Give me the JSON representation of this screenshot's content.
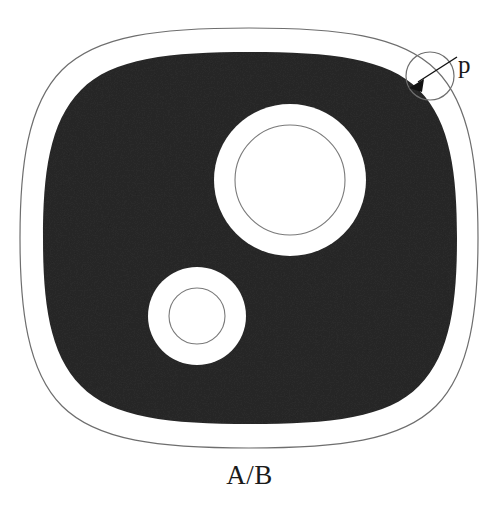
{
  "figure": {
    "title": "A/B",
    "caption": "A/B",
    "annotation_label": "p",
    "colors": {
      "background": "#ffffff",
      "fill_dark": "#2b2b2b",
      "contour_line": "#6e6e6e",
      "text": "#1a1a1a",
      "arrow": "#111111"
    },
    "shapes": {
      "outer_contour": {
        "name": "set-A-boundary",
        "type": "squircle",
        "center": [
          249,
          238
        ],
        "half_width": 230,
        "half_height": 210,
        "stroke_width": 1.1
      },
      "eroded_region": {
        "name": "eroded-region",
        "type": "squircle",
        "center": [
          250,
          238
        ],
        "half_width": 207,
        "half_height": 186,
        "fill": "#2b2b2b"
      },
      "hole_large": {
        "name": "large-hole",
        "center": [
          290,
          180
        ],
        "outer_radius": 76,
        "inner_radius": 55
      },
      "hole_small": {
        "name": "small-hole",
        "center": [
          197,
          316
        ],
        "outer_radius": 49,
        "inner_radius": 28
      },
      "structuring_element": {
        "name": "structuring-element-disk",
        "center": [
          430,
          76
        ],
        "radius": 24
      },
      "arrow": {
        "name": "p-arrow",
        "from": [
          456,
          58
        ],
        "to": [
          413,
          85
        ]
      }
    },
    "structuring_element_radius_label": "p"
  }
}
